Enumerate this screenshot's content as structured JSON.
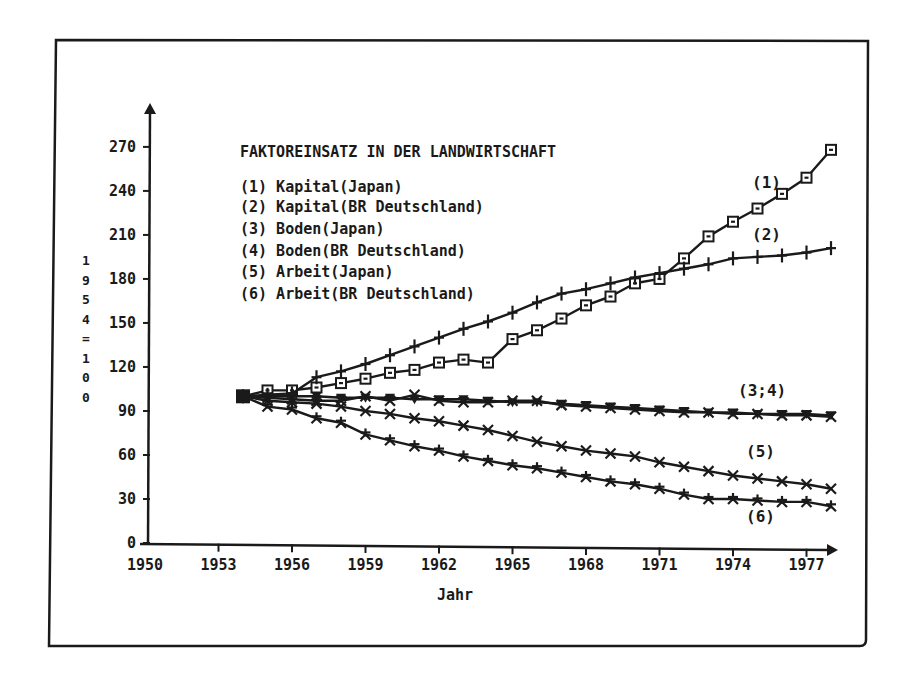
{
  "chart_data": {
    "type": "line",
    "title": "FAKTOREINSATZ IN DER LANDWIRTSCHAFT",
    "xlabel": "Jahr",
    "ylabel": "1954=100",
    "xlim": [
      1950,
      1978
    ],
    "ylim": [
      0,
      285
    ],
    "x_ticks": [
      1950,
      1953,
      1956,
      1959,
      1962,
      1965,
      1968,
      1971,
      1974,
      1977
    ],
    "y_ticks": [
      0,
      30,
      60,
      90,
      120,
      150,
      180,
      210,
      240,
      270
    ],
    "grid": false,
    "legend_position": "top-left (inside plot)",
    "x": [
      1954,
      1955,
      1956,
      1957,
      1958,
      1959,
      1960,
      1961,
      1962,
      1963,
      1964,
      1965,
      1966,
      1967,
      1968,
      1969,
      1970,
      1971,
      1972,
      1973,
      1974,
      1975,
      1976,
      1977,
      1978
    ],
    "series": [
      {
        "id": 1,
        "name": "(1) Kapital(Japan)",
        "marker": "square",
        "values": [
          100,
          104,
          104,
          106,
          109,
          112,
          116,
          118,
          123,
          125,
          123,
          139,
          145,
          153,
          162,
          168,
          177,
          180,
          194,
          209,
          219,
          228,
          238,
          249,
          268
        ]
      },
      {
        "id": 2,
        "name": "(2) Kapital(BR Deutschland)",
        "marker": "plus",
        "values": [
          100,
          101,
          102,
          113,
          117,
          122,
          128,
          134,
          140,
          146,
          151,
          157,
          164,
          170,
          173,
          177,
          181,
          184,
          187,
          190,
          194,
          195,
          196,
          198,
          201
        ]
      },
      {
        "id": 3,
        "name": "(3) Boden(Japan)",
        "marker": "down-triangle",
        "values": [
          100,
          100,
          100,
          100,
          99,
          99,
          99,
          98,
          98,
          98,
          97,
          96,
          96,
          95,
          94,
          93,
          92,
          91,
          90,
          89,
          89,
          88,
          88,
          88,
          87
        ]
      },
      {
        "id": 4,
        "name": "(4) Boden(BR Deutschland)",
        "marker": "x",
        "values": [
          100,
          99,
          98,
          97,
          97,
          100,
          97,
          101,
          97,
          96,
          96,
          97,
          97,
          94,
          93,
          92,
          91,
          90,
          89,
          89,
          88,
          88,
          87,
          87,
          86
        ]
      },
      {
        "id": 5,
        "name": "(5) Arbeit(Japan)",
        "marker": "x",
        "values": [
          100,
          97,
          96,
          95,
          93,
          90,
          88,
          85,
          83,
          80,
          77,
          73,
          69,
          66,
          63,
          61,
          59,
          55,
          52,
          49,
          46,
          44,
          42,
          40,
          37
        ]
      },
      {
        "id": 6,
        "name": "(6) Arbeit(BR Deutschland)",
        "marker": "asterisk",
        "values": [
          100,
          93,
          91,
          85,
          82,
          74,
          70,
          66,
          63,
          59,
          56,
          53,
          51,
          48,
          45,
          42,
          40,
          37,
          33,
          30,
          30,
          29,
          28,
          28,
          25
        ]
      }
    ],
    "annotations": [
      "(1)",
      "(2)",
      "(3;4)",
      "(5)",
      "(6)"
    ]
  },
  "chart": {
    "title": "FAKTOREINSATZ IN DER LANDWIRTSCHAFT",
    "xlabel": "Jahr",
    "ylabel_chars": [
      "1",
      "9",
      "5",
      "4",
      "=",
      "1",
      "0",
      "0"
    ],
    "x_tick_labels": [
      "1950",
      "1953",
      "1956",
      "1959",
      "1962",
      "1965",
      "1968",
      "1971",
      "1974",
      "1977"
    ],
    "y_tick_labels": [
      "0",
      "30",
      "60",
      "90",
      "120",
      "150",
      "180",
      "210",
      "240",
      "270"
    ],
    "legend": [
      "(1) Kapital(Japan)",
      "(2) Kapital(BR Deutschland)",
      "(3) Boden(Japan)",
      "(4) Boden(BR Deutschland)",
      "(5) Arbeit(Japan)",
      "(6) Arbeit(BR Deutschland)"
    ],
    "series_labels": {
      "s1": "(1)",
      "s2": "(2)",
      "s34": "(3;4)",
      "s5": "(5)",
      "s6": "(6)"
    },
    "colors": {
      "ink": "#1a1a1a",
      "background": "#ffffff"
    }
  }
}
